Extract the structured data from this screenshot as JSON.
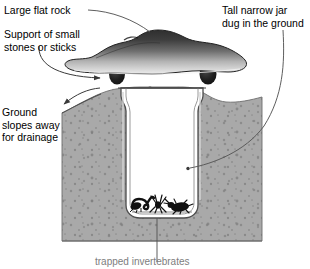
{
  "diagram": {
    "background_color": "#ffffff",
    "soil_color": "#a9a9a9",
    "soil_speckle_color": "#8a8a8a",
    "rock_dark_color": "#3a3a3a",
    "rock_light_color": "#e2e2e2",
    "stone_color": "#262626",
    "jar_glass_color": "#ffffff",
    "jar_outline_color": "#4a4a4a",
    "line_color": "#555555",
    "text_color": "#000000"
  },
  "labels": {
    "rock": "Large flat rock",
    "support": "Support of small\nstones or sticks",
    "ground": "Ground\nslopes away\nfor drainage",
    "jar": "Tall narrow jar\ndug in the ground",
    "bottom_caption": "trapped invertebrates"
  },
  "icons": {
    "leader_rock": "leader-line-icon",
    "leader_jar": "leader-line-icon",
    "leader_bottom": "leader-line-icon",
    "arrow_support": "arrow-right-icon",
    "arrow_ground": "arrow-left-icon",
    "dot_endpoint": "dot-endpoint-icon"
  },
  "scene": {
    "flat_rock": "large-flat-rock",
    "support_stone_left": "support-stone-left",
    "support_stone_right": "support-stone-right",
    "soil": "soil-cross-section",
    "jar": "tall-narrow-jar",
    "invertebrates": [
      {
        "name": "earwig",
        "x": 137,
        "y": 206
      },
      {
        "name": "spider",
        "x": 158,
        "y": 204
      },
      {
        "name": "beetle",
        "x": 180,
        "y": 208
      }
    ]
  }
}
